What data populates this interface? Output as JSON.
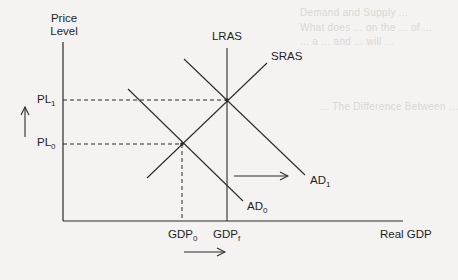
{
  "background_bleed_text": [
    "Demand and Supply ...",
    "What does ... on the ... of ...",
    "... a ... and ... will ...",
    "... The Difference Between ..."
  ],
  "axes": {
    "y_label_line1": "Price",
    "y_label_line2": "Level",
    "x_label": "Real GDP"
  },
  "curves": {
    "lras": "LRAS",
    "sras": "SRAS",
    "ad0_base": "AD",
    "ad0_sub": "0",
    "ad1_base": "AD",
    "ad1_sub": "1"
  },
  "price_levels": {
    "pl1_base": "PL",
    "pl1_sub": "1",
    "pl0_base": "PL",
    "pl0_sub": "0"
  },
  "gdp_levels": {
    "gdp0_base": "GDP",
    "gdp0_sub": "0",
    "gdpf_base": "GDP",
    "gdpf_sub": "f"
  },
  "arrows": {
    "price_shift": "up",
    "ad_shift": "right",
    "gdp_shift": "right"
  },
  "colors": {
    "line": "#2a2a2a",
    "background": "#f4f3f1"
  }
}
